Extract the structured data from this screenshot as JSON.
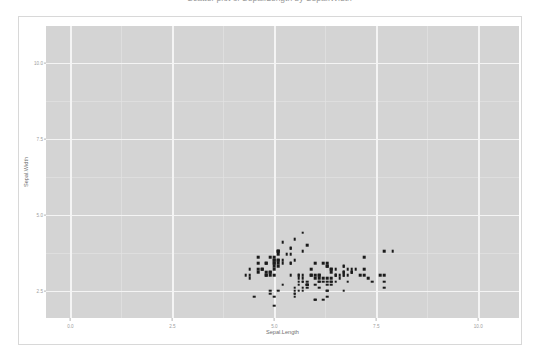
{
  "chart_data": {
    "type": "scatter",
    "title": "Scatter plot of Sepal.Length by Sepal.Width",
    "xlabel": "Sepal.Length",
    "ylabel": "Sepal.Width",
    "xlim": [
      -0.6,
      11.0
    ],
    "ylim": [
      1.6,
      11.2
    ],
    "xticks": [
      "0.0",
      "2.5",
      "5.0",
      "7.5",
      "10.0"
    ],
    "xtick_values": [
      0.0,
      2.5,
      5.0,
      7.5,
      10.0
    ],
    "yticks": [
      "2.5",
      "5.0",
      "7.5",
      "10.0"
    ],
    "ytick_values": [
      2.5,
      5.0,
      7.5,
      10.0
    ],
    "grid": true,
    "legend": "none",
    "panel_background": "#d4d4d4",
    "gridline_color": "#f4f4f4",
    "point_color": "#1a1a1a",
    "n_points": 150,
    "x": [
      5.1,
      4.9,
      4.7,
      4.6,
      5.0,
      5.4,
      4.6,
      5.0,
      4.4,
      4.9,
      5.4,
      4.8,
      4.8,
      4.3,
      5.8,
      5.7,
      5.4,
      5.1,
      5.7,
      5.1,
      5.4,
      5.1,
      4.6,
      5.1,
      4.8,
      5.0,
      5.0,
      5.2,
      5.2,
      4.7,
      4.8,
      5.4,
      5.2,
      5.5,
      4.9,
      5.0,
      5.5,
      4.9,
      4.4,
      5.1,
      5.0,
      4.5,
      4.4,
      5.0,
      5.1,
      4.8,
      5.1,
      4.6,
      5.3,
      5.0,
      7.0,
      6.4,
      6.9,
      5.5,
      6.5,
      5.7,
      6.3,
      4.9,
      6.6,
      5.2,
      5.0,
      5.9,
      6.0,
      6.1,
      5.6,
      6.7,
      5.6,
      5.8,
      6.2,
      5.6,
      5.9,
      6.1,
      6.3,
      6.1,
      6.4,
      6.6,
      6.8,
      6.7,
      6.0,
      5.7,
      5.5,
      5.5,
      5.8,
      6.0,
      5.4,
      6.0,
      6.7,
      6.3,
      5.6,
      5.5,
      5.5,
      6.1,
      5.8,
      5.0,
      5.6,
      5.7,
      5.7,
      6.2,
      5.1,
      5.7,
      6.3,
      5.8,
      7.1,
      6.3,
      6.5,
      7.6,
      4.9,
      7.3,
      6.7,
      7.2,
      6.5,
      6.4,
      6.8,
      5.7,
      5.8,
      6.4,
      6.5,
      7.7,
      7.7,
      6.0,
      6.9,
      5.6,
      7.7,
      6.3,
      6.7,
      7.2,
      6.2,
      6.1,
      6.4,
      7.2,
      7.4,
      7.9,
      6.4,
      6.3,
      6.1,
      7.7,
      6.3,
      6.4,
      6.0,
      6.9,
      6.7,
      6.9,
      5.8,
      6.8,
      6.7,
      6.7,
      6.3,
      6.5,
      6.2,
      5.9
    ],
    "y": [
      3.5,
      3.0,
      3.2,
      3.1,
      3.6,
      3.9,
      3.4,
      3.4,
      2.9,
      3.1,
      3.7,
      3.4,
      3.0,
      3.0,
      4.0,
      4.4,
      3.9,
      3.5,
      3.8,
      3.8,
      3.4,
      3.7,
      3.6,
      3.3,
      3.4,
      3.0,
      3.4,
      3.5,
      3.4,
      3.2,
      3.1,
      3.4,
      4.1,
      4.2,
      3.1,
      3.2,
      3.5,
      3.6,
      3.0,
      3.4,
      3.5,
      2.3,
      3.2,
      3.5,
      3.8,
      3.0,
      3.8,
      3.2,
      3.7,
      3.3,
      3.2,
      3.2,
      3.1,
      2.3,
      2.8,
      2.8,
      3.3,
      2.4,
      2.9,
      2.7,
      2.0,
      3.0,
      2.2,
      2.9,
      2.9,
      3.1,
      3.0,
      2.7,
      2.2,
      2.5,
      3.2,
      2.8,
      2.5,
      2.8,
      2.9,
      3.0,
      2.8,
      3.0,
      2.9,
      2.6,
      2.4,
      2.4,
      2.7,
      2.7,
      3.0,
      3.4,
      3.1,
      2.3,
      3.0,
      2.5,
      2.6,
      3.0,
      2.6,
      2.3,
      2.7,
      3.0,
      2.9,
      2.9,
      2.5,
      2.8,
      3.3,
      2.7,
      3.0,
      2.9,
      3.0,
      3.0,
      2.5,
      2.9,
      2.5,
      3.6,
      3.2,
      2.7,
      3.0,
      2.5,
      2.8,
      3.2,
      3.0,
      3.8,
      2.6,
      2.2,
      3.2,
      2.8,
      2.8,
      2.7,
      3.3,
      3.2,
      2.8,
      3.0,
      2.8,
      3.0,
      2.8,
      3.8,
      2.8,
      2.8,
      2.6,
      3.0,
      3.4,
      3.1,
      3.0,
      3.1,
      3.1,
      3.1,
      2.7,
      3.2,
      3.3,
      3.0,
      2.5,
      3.0,
      3.4,
      3.0
    ]
  }
}
